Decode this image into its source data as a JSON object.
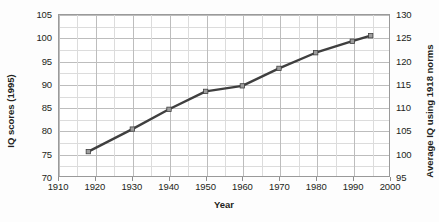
{
  "chart_data": {
    "type": "line",
    "title": "",
    "xlabel": "Year",
    "ylabel": "IQ scores (1995)",
    "y2label": "Average IQ using 1918 norms",
    "x": [
      1918,
      1930,
      1940,
      1950,
      1960,
      1970,
      1980,
      1990,
      1995
    ],
    "values": [
      75.3,
      80.2,
      84.5,
      88.4,
      89.6,
      93.4,
      96.8,
      99.3,
      100.5
    ],
    "series": [
      {
        "name": "IQ scores (1995)",
        "values": [
          75.3,
          80.2,
          84.5,
          88.4,
          89.6,
          93.4,
          96.8,
          99.3,
          100.5
        ],
        "color": "#3f3f3f",
        "marker": "square"
      }
    ],
    "xlim": [
      1910,
      2000
    ],
    "ylim": [
      70,
      105
    ],
    "y2lim": [
      95,
      130
    ],
    "xticks": [
      "1910",
      "1920",
      "1930",
      "1940",
      "1950",
      "1960",
      "1970",
      "1980",
      "1990",
      "2000"
    ],
    "yticks": [
      "70",
      "75",
      "80",
      "85",
      "90",
      "95",
      "100",
      "105"
    ],
    "y2ticks": [
      "95",
      "100",
      "105",
      "110",
      "115",
      "120",
      "125",
      "130"
    ],
    "grid": true,
    "legend": "none",
    "gridlines_x_minor": [
      1915,
      1925,
      1935,
      1945,
      1955,
      1965,
      1975,
      1985,
      1995
    ]
  },
  "axes": {
    "x_title": "Year",
    "y_left_title": "IQ scores (1995)",
    "y_right_title": "Average IQ using 1918 norms"
  },
  "ticks": {
    "left": [
      "105",
      "100",
      "95",
      "90",
      "85",
      "80",
      "75",
      "70"
    ],
    "right": [
      "130",
      "125",
      "120",
      "115",
      "110",
      "105",
      "100",
      "95"
    ],
    "bottom": [
      "1910",
      "1920",
      "1930",
      "1940",
      "1950",
      "1960",
      "1970",
      "1980",
      "1990",
      "2000"
    ]
  },
  "colors": {
    "line": "#3f3f3f",
    "marker_fill": "#9e9e9e",
    "grid": "#c9c9c9",
    "frame": "#9a9a9a",
    "text": "#231f20",
    "background": "#fdfdfd"
  }
}
